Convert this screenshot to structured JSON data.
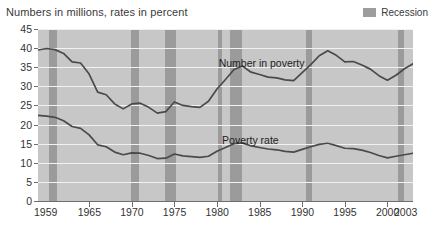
{
  "header": {
    "title": "Numbers in millions, rates in percent",
    "legend": {
      "swatch_name": "recession-swatch",
      "label": "Recession",
      "color": "#9b9b9b"
    }
  },
  "annotations": {
    "series1": "Number in poverty",
    "series2": "Poverty rate"
  },
  "chart_data": {
    "type": "line",
    "title": "Numbers in millions, rates in percent",
    "xlabel": "",
    "ylabel": "",
    "xlim": [
      1959,
      2003
    ],
    "ylim": [
      0,
      45
    ],
    "grid": true,
    "legend_position": "top-right",
    "plot_bg": "#c7c7c7",
    "line_color": "#4a4a4a",
    "gridline_color": "#f2f2f2",
    "ytick_labels": [
      "45",
      "40",
      "35",
      "30",
      "25",
      "20",
      "15",
      "10",
      "5",
      "0"
    ],
    "ytick_values": [
      45,
      40,
      35,
      30,
      25,
      20,
      15,
      10,
      5,
      0
    ],
    "xtick_labels": [
      "1959",
      "1965",
      "1970",
      "1975",
      "1980",
      "1985",
      "1990",
      "1995",
      "2000",
      "2003"
    ],
    "xtick_values": [
      1959,
      1965,
      1970,
      1975,
      1980,
      1985,
      1990,
      1995,
      2000,
      2003
    ],
    "recessions": [
      {
        "start": 1960.3,
        "end": 1961.2
      },
      {
        "start": 1969.9,
        "end": 1970.9
      },
      {
        "start": 1973.9,
        "end": 1975.2
      },
      {
        "start": 1980.1,
        "end": 1980.6
      },
      {
        "start": 1981.5,
        "end": 1982.9
      },
      {
        "start": 1990.5,
        "end": 1991.2
      },
      {
        "start": 2001.2,
        "end": 2001.9
      }
    ],
    "x": [
      1959,
      1960,
      1961,
      1962,
      1963,
      1964,
      1965,
      1966,
      1967,
      1968,
      1969,
      1970,
      1971,
      1972,
      1973,
      1974,
      1975,
      1976,
      1977,
      1978,
      1979,
      1980,
      1981,
      1982,
      1983,
      1984,
      1985,
      1986,
      1987,
      1988,
      1989,
      1990,
      1991,
      1992,
      1993,
      1994,
      1995,
      1996,
      1997,
      1998,
      1999,
      2000,
      2001,
      2002,
      2003
    ],
    "series": [
      {
        "name": "Number in poverty",
        "unit": "millions",
        "values": [
          39.5,
          39.9,
          39.6,
          38.6,
          36.4,
          36.1,
          33.2,
          28.5,
          27.8,
          25.4,
          24.1,
          25.4,
          25.6,
          24.5,
          23.0,
          23.4,
          25.9,
          25.0,
          24.7,
          24.5,
          26.1,
          29.3,
          31.8,
          34.4,
          35.3,
          33.7,
          33.1,
          32.4,
          32.2,
          31.7,
          31.5,
          33.6,
          35.7,
          38.0,
          39.3,
          38.1,
          36.4,
          36.5,
          35.6,
          34.5,
          32.8,
          31.6,
          32.9,
          34.6,
          35.9
        ]
      },
      {
        "name": "Poverty rate",
        "unit": "percent",
        "values": [
          22.4,
          22.2,
          21.9,
          21.0,
          19.5,
          19.0,
          17.3,
          14.7,
          14.2,
          12.8,
          12.1,
          12.6,
          12.5,
          11.9,
          11.1,
          11.2,
          12.3,
          11.8,
          11.6,
          11.4,
          11.7,
          13.0,
          14.0,
          15.0,
          15.2,
          14.4,
          14.0,
          13.6,
          13.4,
          13.0,
          12.8,
          13.5,
          14.2,
          14.8,
          15.1,
          14.5,
          13.8,
          13.7,
          13.3,
          12.7,
          11.9,
          11.3,
          11.7,
          12.1,
          12.5
        ]
      }
    ]
  }
}
